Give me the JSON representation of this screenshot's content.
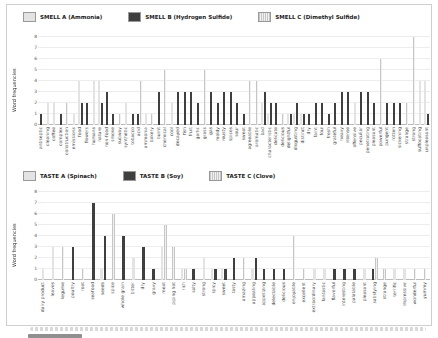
{
  "figure": {
    "ylabel": "Word frequencies",
    "yticks": [
      0,
      1,
      2,
      3,
      4,
      5,
      6,
      7,
      8
    ]
  },
  "colors": {
    "series_a_fill": "#e3e3e3",
    "series_a_dot": "#8f8f8f",
    "series_b_fill": "#3f3f3f",
    "series_b_dot": "#111111",
    "series_c_fill": "#f0f0f0",
    "series_c_line": "#c6c6c6",
    "grid": "#ededed",
    "axis_text": "#555555",
    "border": "#cfcfcf"
  },
  "chart_data": [
    {
      "type": "bar",
      "title": "",
      "ylabel": "Word frequencies",
      "xlabel": "",
      "ylim": [
        0,
        8
      ],
      "yticks": [
        0,
        1,
        2,
        3,
        4,
        5,
        6,
        7,
        8
      ],
      "grid": true,
      "legend_position": "top-left",
      "legend": [
        "SMELL A (Ammonia)",
        "SMELL B (Hydrogen Sulfide)",
        "SMELL C (Dimethyl Sulfide)"
      ],
      "series_keys": [
        "A",
        "B",
        "C"
      ],
      "points": [
        [
          "antiseptic",
          0,
          1,
          0
        ],
        [
          "cleaning",
          2,
          0,
          0
        ],
        [
          "coffee",
          2,
          0,
          0
        ],
        [
          "complex",
          0,
          1,
          0
        ],
        [
          "construction",
          0,
          0,
          2
        ],
        [
          "emissions",
          1,
          0,
          0
        ],
        [
          "food",
          4,
          2,
          0
        ],
        [
          "flowers",
          0,
          2,
          0
        ],
        [
          "humans",
          4,
          0,
          0
        ],
        [
          "nature",
          4,
          2,
          0
        ],
        [
          "non-food",
          0,
          3,
          0
        ],
        [
          "smoke",
          0,
          1,
          0
        ],
        [
          "subway",
          0,
          0,
          1
        ],
        [
          "synthetic",
          2,
          0,
          0
        ],
        [
          "tobacco",
          0,
          1,
          0
        ],
        [
          "acid",
          0,
          1,
          4
        ],
        [
          "ammonia",
          1,
          0,
          0
        ],
        [
          "bakery",
          0,
          0,
          1
        ],
        [
          "burnt",
          0,
          3,
          0
        ],
        [
          "chemical",
          0,
          0,
          5
        ],
        [
          "cool",
          2,
          0,
          0
        ],
        [
          "decayed",
          0,
          3,
          0
        ],
        [
          "fish",
          0,
          3,
          0
        ],
        [
          "fruit",
          0,
          3,
          0
        ],
        [
          "garlic",
          0,
          2,
          0
        ],
        [
          "grass",
          0,
          0,
          5
        ],
        [
          "gas",
          0,
          3,
          0
        ],
        [
          "moldy",
          0,
          2,
          0
        ],
        [
          "musty",
          0,
          3,
          0
        ],
        [
          "spices",
          0,
          3,
          0
        ],
        [
          "sour",
          0,
          2,
          0
        ],
        [
          "sweat",
          0,
          1,
          0
        ],
        [
          "agreeable",
          0,
          0,
          4
        ],
        [
          "aromatic",
          0,
          0,
          4
        ],
        [
          "bad",
          2,
          3,
          0
        ],
        [
          "characteristic",
          1,
          2,
          0
        ],
        [
          "delicate",
          0,
          2,
          0
        ],
        [
          "delicious",
          0,
          0,
          1
        ],
        [
          "delightful",
          1,
          1,
          0
        ],
        [
          "disgusting",
          1,
          2,
          0
        ],
        [
          "distinct",
          1,
          1,
          0
        ],
        [
          "dry",
          0,
          1,
          0
        ],
        [
          "faint",
          0,
          2,
          0
        ],
        [
          "foul",
          0,
          2,
          0
        ],
        [
          "fresh",
          0,
          1,
          0
        ],
        [
          "grateful",
          0,
          2,
          0
        ],
        [
          "heavy",
          0,
          3,
          0
        ],
        [
          "intense",
          0,
          3,
          0
        ],
        [
          "offensive",
          2,
          0,
          0
        ],
        [
          "peculiar",
          0,
          3,
          0
        ],
        [
          "penetrating",
          0,
          3,
          0
        ],
        [
          "pleasant",
          0,
          2,
          0
        ],
        [
          "powerful",
          0,
          0,
          6
        ],
        [
          "pungent",
          0,
          2,
          0
        ],
        [
          "rotten",
          0,
          2,
          0
        ],
        [
          "sickening",
          0,
          2,
          0
        ],
        [
          "strange",
          0,
          0,
          2
        ],
        [
          "strong",
          0,
          0,
          8
        ],
        [
          "suffocating",
          4,
          0,
          0
        ],
        [
          "unpleasant",
          4,
          1,
          0
        ]
      ]
    },
    {
      "type": "bar",
      "title": "",
      "ylabel": "Word frequencies",
      "xlabel": "",
      "ylim": [
        0,
        8
      ],
      "yticks": [
        0,
        1,
        2,
        3,
        4,
        5,
        6,
        7,
        8
      ],
      "grid": true,
      "legend_position": "top-left",
      "legend": [
        "TASTE A (Spinach)",
        "TASTE B (Soy)",
        "TASTE C (Clove)"
      ],
      "series_keys": [
        "A",
        "B",
        "C"
      ],
      "points": [
        [
          "dairy product",
          1,
          0,
          0
        ],
        [
          "leaves",
          3,
          0,
          0
        ],
        [
          "legume",
          0,
          0,
          3
        ],
        [
          "poultry",
          0,
          3,
          0
        ],
        [
          "root",
          0,
          0,
          1
        ],
        [
          "seafood",
          0,
          7,
          0
        ],
        [
          "seeds",
          1,
          4,
          0
        ],
        [
          "spice",
          0,
          0,
          6
        ],
        [
          "whole grain",
          0,
          4,
          0
        ],
        [
          "bitter",
          2,
          0,
          0
        ],
        [
          "dry",
          0,
          3,
          0
        ],
        [
          "gravy",
          0,
          1,
          0
        ],
        [
          "meat",
          3,
          0,
          5
        ],
        [
          "piping hot",
          0,
          0,
          3
        ],
        [
          "rich",
          1,
          0,
          1
        ],
        [
          "salty",
          0,
          1,
          0
        ],
        [
          "strong",
          2,
          0,
          0
        ],
        [
          "spicy",
          1,
          1,
          0
        ],
        [
          "sweet",
          1,
          1,
          0
        ],
        [
          "tasty",
          0,
          2,
          0
        ],
        [
          "amazing",
          0,
          0,
          2
        ],
        [
          "appealing",
          1,
          2,
          0
        ],
        [
          "appetizing",
          0,
          1,
          0
        ],
        [
          "delectable",
          0,
          1,
          0
        ],
        [
          "delicious",
          0,
          1,
          0
        ],
        [
          "enjoyable",
          0,
          0,
          4
        ],
        [
          "excellent",
          0,
          0,
          1
        ],
        [
          "extraordinary",
          1,
          0,
          0
        ],
        [
          "fantastic",
          1,
          0,
          0
        ],
        [
          "flavorful",
          0,
          1,
          0
        ],
        [
          "interesting",
          0,
          1,
          0
        ],
        [
          "palatable",
          0,
          1,
          0
        ],
        [
          "pleasant",
          1,
          0,
          0
        ],
        [
          "satisfying",
          0,
          1,
          2
        ],
        [
          "strange",
          0,
          0,
          1
        ],
        [
          "terrific",
          1,
          0,
          0
        ],
        [
          "impressive",
          1,
          0,
          0
        ],
        [
          "wonderful",
          0,
          0,
          1
        ],
        [
          "yummy",
          0,
          0,
          1
        ]
      ]
    }
  ]
}
